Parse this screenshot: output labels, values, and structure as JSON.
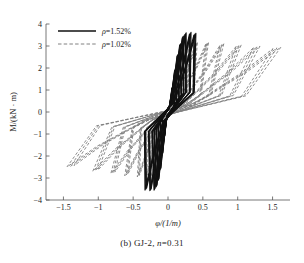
{
  "figure": {
    "caption_prefix": "(b) GJ-2, ",
    "caption_italic": "n",
    "caption_suffix": "=0.31"
  },
  "chart_data": {
    "type": "line",
    "title": "",
    "subtitle": "",
    "xlabel": "φ/(1/m)",
    "ylabel": "M/(kN · m)",
    "xlim": [
      -1.75,
      1.75
    ],
    "ylim": [
      -4,
      4
    ],
    "xticks": [
      -1.5,
      -1,
      -0.5,
      0,
      0.5,
      1,
      1.5
    ],
    "xticklabels": [
      "−1.5",
      "−1",
      "−0.5",
      "0",
      "0.5",
      "1",
      "1.5"
    ],
    "yticks": [
      -4,
      -3,
      -2,
      -1,
      0,
      1,
      2,
      3,
      4
    ],
    "yticklabels": [
      "−4",
      "−3",
      "−2",
      "−1",
      "0",
      "1",
      "2",
      "3",
      "4"
    ],
    "grid": false,
    "legend_position": "upper-left",
    "series": [
      {
        "name": "ρ=1.52%",
        "label_prefix": "ρ",
        "label_suffix": "=1.52%",
        "style": "solid",
        "color": "#111111",
        "width": 1.15,
        "description": "Solid black hysteresis loops, narrow steep parallelograms",
        "loops": [
          {
            "phi_max": 0.06,
            "M_max": 1.1,
            "phi_min": -0.05,
            "M_min": -1.1,
            "pinch": 0.2
          },
          {
            "phi_max": 0.1,
            "M_max": 1.9,
            "phi_min": -0.08,
            "M_min": -1.9,
            "pinch": 0.24
          },
          {
            "phi_max": 0.14,
            "M_max": 2.6,
            "phi_min": -0.11,
            "M_min": -2.6,
            "pinch": 0.28
          },
          {
            "phi_max": 0.18,
            "M_max": 3.1,
            "phi_min": -0.14,
            "M_min": -3.1,
            "pinch": 0.32
          },
          {
            "phi_max": 0.22,
            "M_max": 3.45,
            "phi_min": -0.17,
            "M_min": -3.4,
            "pinch": 0.36
          },
          {
            "phi_max": 0.26,
            "M_max": 3.6,
            "phi_min": -0.2,
            "M_min": -3.55,
            "pinch": 0.4
          },
          {
            "phi_max": 0.33,
            "M_max": 3.62,
            "phi_min": -0.26,
            "M_min": -3.58,
            "pinch": 0.46
          },
          {
            "phi_max": 0.4,
            "M_max": 3.58,
            "phi_min": -0.33,
            "M_min": -3.55,
            "pinch": 0.52
          }
        ],
        "outer_loop": {
          "phi_max": 0.4,
          "M_max": 3.6,
          "phi_min": -0.34,
          "M_min": -3.6
        }
      },
      {
        "name": "ρ=1.02%",
        "label_prefix": "ρ",
        "label_suffix": "=1.02%",
        "style": "dashed",
        "color": "#808080",
        "width": 0.9,
        "dash": "3,2",
        "description": "Gray dashed hysteresis loops, progressively wider fat loops",
        "loops": [
          {
            "phi_max": 0.07,
            "M_max": 1.2,
            "phi_min": -0.06,
            "M_min": -1.2,
            "pinch": 0.22
          },
          {
            "phi_max": 0.11,
            "M_max": 2.0,
            "phi_min": -0.09,
            "M_min": -2.0,
            "pinch": 0.26
          },
          {
            "phi_max": 0.16,
            "M_max": 2.6,
            "phi_min": -0.13,
            "M_min": -2.55,
            "pinch": 0.3
          },
          {
            "phi_max": 0.22,
            "M_max": 2.95,
            "phi_min": -0.18,
            "M_min": -2.8,
            "pinch": 0.34
          },
          {
            "phi_max": 0.3,
            "M_max": 3.1,
            "phi_min": -0.24,
            "M_min": -2.9,
            "pinch": 0.4
          },
          {
            "phi_max": 0.42,
            "M_max": 3.15,
            "phi_min": -0.32,
            "M_min": -2.95,
            "pinch": 0.46
          },
          {
            "phi_max": 0.58,
            "M_max": 3.15,
            "phi_min": -0.44,
            "M_min": -2.95,
            "pinch": 0.52
          },
          {
            "phi_max": 0.8,
            "M_max": 3.1,
            "phi_min": -0.62,
            "M_min": -2.9,
            "pinch": 0.58
          },
          {
            "phi_max": 1.05,
            "M_max": 3.05,
            "phi_min": -0.82,
            "M_min": -2.8,
            "pinch": 0.64
          },
          {
            "phi_max": 1.32,
            "M_max": 3.0,
            "phi_min": -1.08,
            "M_min": -2.7,
            "pinch": 0.7
          },
          {
            "phi_max": 1.62,
            "M_max": 2.95,
            "phi_min": -1.45,
            "M_min": -2.5,
            "pinch": 0.76
          }
        ],
        "outer_loop": {
          "phi_max": 1.62,
          "M_max": 3.0,
          "phi_min": -1.5,
          "M_min": -2.5
        }
      }
    ],
    "annotations": []
  }
}
